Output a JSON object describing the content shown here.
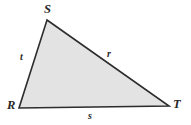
{
  "figure": {
    "type": "geometry-diagram",
    "shape": "triangle",
    "colors": {
      "background": "#ffffff",
      "fill": "#e3e3e3",
      "stroke": "#2d2d2d",
      "label": "#272727"
    },
    "stroke_width": 1.6,
    "vertices": [
      {
        "name": "S",
        "label": "S",
        "x": 47,
        "y": 20,
        "label_x": 44,
        "label_y": 3
      },
      {
        "name": "R",
        "label": "R",
        "x": 19,
        "y": 108,
        "label_x": 7,
        "label_y": 99
      },
      {
        "name": "T",
        "label": "T",
        "x": 169,
        "y": 106,
        "label_x": 173,
        "label_y": 98
      }
    ],
    "sides": [
      {
        "name": "t",
        "label": "t",
        "between": "R-S",
        "label_x": 20,
        "label_y": 52
      },
      {
        "name": "r",
        "label": "r",
        "between": "S-T",
        "label_x": 107,
        "label_y": 49
      },
      {
        "name": "s",
        "label": "s",
        "between": "R-T",
        "label_x": 88,
        "label_y": 111
      }
    ],
    "polygon_points": "47,20 169,106 19,108"
  }
}
